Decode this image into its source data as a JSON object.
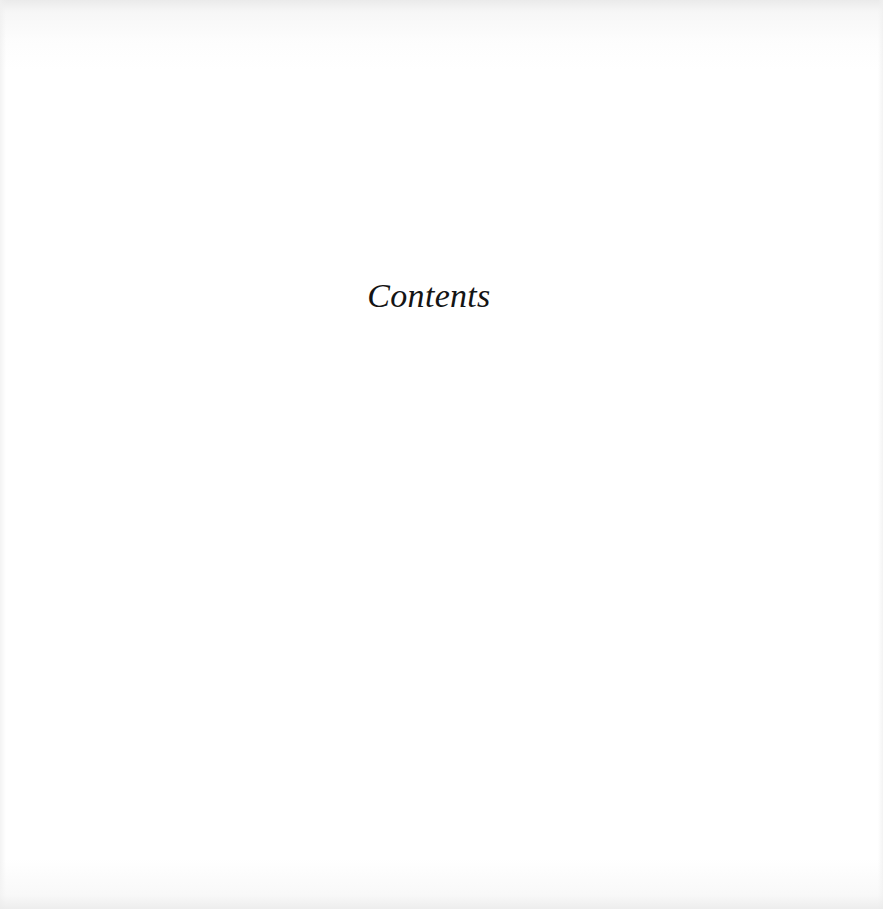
{
  "page": {
    "heading": "Contents",
    "background_color": "#ffffff",
    "text_color": "#141414"
  }
}
